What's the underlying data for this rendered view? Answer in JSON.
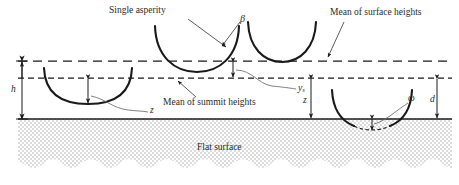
{
  "figure": {
    "domain": "engineering-diagram",
    "background_color": "#ffffff",
    "line_color": "#1a1a1a",
    "stipple_color": "#9a9a9a",
    "width": 459,
    "height": 185
  },
  "labels": {
    "single_asperity": "Single asperity",
    "mean_surface_heights": "Mean of surface heights",
    "mean_summit_heights": "Mean of summit heights",
    "flat_surface": "Flat surface",
    "beta": "β",
    "omega": "ω",
    "h": "h",
    "d": "d",
    "z_left": "z",
    "z_right": "z",
    "ys_symbol": "y",
    "ys_subscript": "s"
  },
  "reference_lines": [
    {
      "name": "mean-surface-heights-line",
      "style": "dashed",
      "y": 61,
      "x1": 18,
      "x2": 452
    },
    {
      "name": "mean-summit-heights-line",
      "style": "dashed",
      "y": 78,
      "x1": 18,
      "x2": 452
    },
    {
      "name": "flat-surface-line",
      "style": "solid",
      "y": 119,
      "x1": 18,
      "x2": 452
    }
  ],
  "asperities": [
    {
      "name": "asperity-left",
      "cx": 88,
      "base_y": 104,
      "radius_x": 44,
      "top_y": 68,
      "touches": "below-summit-line"
    },
    {
      "name": "asperity-middle",
      "cx": 197,
      "base_y": 72,
      "radius_x": 42,
      "top_y": 26,
      "touches": "surface-line"
    },
    {
      "name": "asperity-right",
      "cx": 282,
      "base_y": 62,
      "radius_x": 34,
      "top_y": 22,
      "touches": "above-surface-line"
    },
    {
      "name": "asperity-contact",
      "cx": 372,
      "base_y": 126,
      "radius_x": 40,
      "top_y": 90,
      "touches": "penetrating-flat-surface"
    }
  ],
  "dimensions": [
    {
      "name": "dimension-h",
      "label": "h",
      "from_y": 61,
      "to_y": 119,
      "x": 22,
      "arrows": "both"
    },
    {
      "name": "dimension-ys",
      "label": "ys",
      "from_y": 61,
      "to_y": 78,
      "x": 233,
      "arrows": "both"
    },
    {
      "name": "dimension-z-left",
      "label": "z",
      "from_y": 78,
      "to_y": 104,
      "x": 88,
      "arrows": "both"
    },
    {
      "name": "dimension-z-right",
      "label": "z",
      "from_y": 78,
      "to_y": 119,
      "x": 311,
      "arrows": "both"
    },
    {
      "name": "dimension-d",
      "label": "d",
      "from_y": 78,
      "to_y": 119,
      "x": 437,
      "arrows": "both"
    },
    {
      "name": "dimension-omega",
      "label": "ω",
      "from_y": 119,
      "to_y": 128,
      "x": 372,
      "arrows": "both"
    }
  ]
}
